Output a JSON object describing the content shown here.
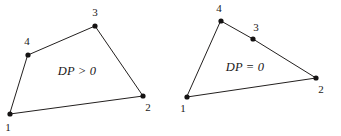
{
  "figure": {
    "background_color": "#ffffff",
    "line_color": "#23201f",
    "vertex_color": "#151313",
    "text_color": "#1a1818",
    "width": 341,
    "height": 136
  },
  "chart_data": {
    "type": "scatter",
    "title": "",
    "xlabel": "",
    "ylabel": "",
    "grid": false,
    "legend": null,
    "xlim": [
      0,
      341
    ],
    "ylim": [
      136,
      0
    ],
    "series": [
      {
        "name": "left-polygon",
        "annotation": "DP > 0",
        "closed": true,
        "points": [
          {
            "label": "1",
            "x": 10,
            "y": 114
          },
          {
            "label": "2",
            "x": 143,
            "y": 96
          },
          {
            "label": "3",
            "x": 95,
            "y": 26
          },
          {
            "label": "4",
            "x": 28,
            "y": 55
          }
        ]
      },
      {
        "name": "right-polygon",
        "annotation": "DP = 0",
        "closed": true,
        "points": [
          {
            "label": "1",
            "x": 187,
            "y": 97
          },
          {
            "label": "2",
            "x": 316,
            "y": 78
          },
          {
            "label": "3",
            "x": 253,
            "y": 39
          },
          {
            "label": "4",
            "x": 221,
            "y": 21
          }
        ]
      }
    ]
  },
  "left_polygon": {
    "name": "left-polygon",
    "region_label": "DP > 0",
    "region_label_x": 77,
    "region_label_y": 72,
    "path": "M 10 114 L 143 96 L 95 26 L 28 55 Z",
    "vertices": [
      {
        "id": "1",
        "label": "1",
        "cx": 10,
        "cy": 114,
        "r": 2.6,
        "label_x": 8,
        "label_y": 128
      },
      {
        "id": "2",
        "label": "2",
        "cx": 143,
        "cy": 96,
        "r": 2.6,
        "label_x": 148,
        "label_y": 108
      },
      {
        "id": "3",
        "label": "3",
        "cx": 95,
        "cy": 26,
        "r": 2.6,
        "label_x": 95,
        "label_y": 13
      },
      {
        "id": "4",
        "label": "4",
        "cx": 28,
        "cy": 55,
        "r": 2.6,
        "label_x": 27,
        "label_y": 42
      }
    ]
  },
  "right_polygon": {
    "name": "right-polygon",
    "region_label": "DP = 0",
    "region_label_x": 245,
    "region_label_y": 68,
    "path": "M 187 97 L 316 78 L 253 39 L 221 21 Z",
    "vertices": [
      {
        "id": "1",
        "label": "1",
        "cx": 187,
        "cy": 97,
        "r": 2.6,
        "label_x": 183,
        "label_y": 109
      },
      {
        "id": "2",
        "label": "2",
        "cx": 316,
        "cy": 78,
        "r": 2.6,
        "label_x": 321,
        "label_y": 90
      },
      {
        "id": "3",
        "label": "3",
        "cx": 253,
        "cy": 39,
        "r": 2.6,
        "label_x": 256,
        "label_y": 28
      },
      {
        "id": "4",
        "label": "4",
        "cx": 221,
        "cy": 21,
        "r": 2.6,
        "label_x": 219,
        "label_y": 9
      }
    ]
  }
}
